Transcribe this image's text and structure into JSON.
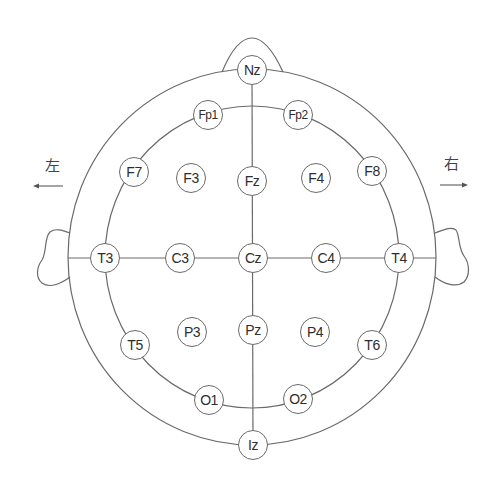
{
  "diagram": {
    "line_color": "#6a6a6a",
    "text_color": "#2e2e2e",
    "direction_labels": {
      "left": {
        "text": "左",
        "arrow": "left-arrow"
      },
      "right": {
        "text": "右",
        "arrow": "right-arrow"
      }
    },
    "electrodes": [
      {
        "id": "Nz",
        "label": "Nz",
        "x": 252,
        "y": 70
      },
      {
        "id": "Fp1",
        "label": "Fp1",
        "x": 208,
        "y": 115
      },
      {
        "id": "Fp2",
        "label": "Fp2",
        "x": 298,
        "y": 115
      },
      {
        "id": "F7",
        "label": "F7",
        "x": 134,
        "y": 172
      },
      {
        "id": "F3",
        "label": "F3",
        "x": 191,
        "y": 178
      },
      {
        "id": "Fz",
        "label": "Fz",
        "x": 252,
        "y": 181
      },
      {
        "id": "F4",
        "label": "F4",
        "x": 316,
        "y": 178
      },
      {
        "id": "F8",
        "label": "F8",
        "x": 372,
        "y": 171
      },
      {
        "id": "T3",
        "label": "T3",
        "x": 105,
        "y": 258
      },
      {
        "id": "C3",
        "label": "C3",
        "x": 180,
        "y": 258
      },
      {
        "id": "Cz",
        "label": "Cz",
        "x": 253,
        "y": 258
      },
      {
        "id": "C4",
        "label": "C4",
        "x": 326,
        "y": 258
      },
      {
        "id": "T4",
        "label": "T4",
        "x": 399,
        "y": 258
      },
      {
        "id": "T5",
        "label": "T5",
        "x": 135,
        "y": 345
      },
      {
        "id": "P3",
        "label": "P3",
        "x": 192,
        "y": 332
      },
      {
        "id": "Pz",
        "label": "Pz",
        "x": 253,
        "y": 330
      },
      {
        "id": "P4",
        "label": "P4",
        "x": 315,
        "y": 332
      },
      {
        "id": "T6",
        "label": "T6",
        "x": 372,
        "y": 345
      },
      {
        "id": "O1",
        "label": "O1",
        "x": 209,
        "y": 400
      },
      {
        "id": "O2",
        "label": "O2",
        "x": 298,
        "y": 399
      },
      {
        "id": "Iz",
        "label": "Iz",
        "x": 253,
        "y": 445
      }
    ]
  }
}
